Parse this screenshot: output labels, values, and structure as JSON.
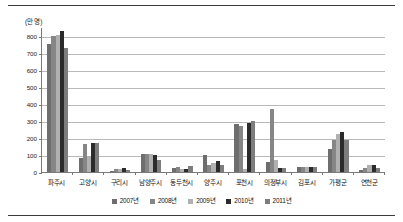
{
  "chart_data": {
    "type": "bar",
    "title": "",
    "subtitle": "",
    "xlabel": "",
    "ylabel": "",
    "unit_label": "(만 명)",
    "ylim": [
      0,
      850
    ],
    "yticks": [
      0,
      100,
      200,
      300,
      400,
      500,
      600,
      700,
      800
    ],
    "ytick_labels": [
      "0",
      "100",
      "200",
      "300",
      "400",
      "500",
      "600",
      "700",
      "800"
    ],
    "grid": true,
    "legend_position": "bottom",
    "categories": [
      "파주시",
      "고양시",
      "구리시",
      "남양주시",
      "동두천시",
      "양주시",
      "포천시",
      "의정부시",
      "김포시",
      "가평군",
      "연천군"
    ],
    "series": [
      {
        "name": "2007년",
        "color": "#6e6e6e",
        "values": [
          750,
          82,
          8,
          105,
          25,
          97,
          282,
          58,
          30,
          137,
          10
        ]
      },
      {
        "name": "2008년",
        "color": "#868686",
        "values": [
          800,
          165,
          18,
          108,
          28,
          42,
          272,
          368,
          32,
          185,
          25
        ]
      },
      {
        "name": "2009년",
        "color": "#b0b0b0",
        "values": [
          805,
          95,
          20,
          105,
          15,
          50,
          20,
          72,
          30,
          225,
          42
        ]
      },
      {
        "name": "2010년",
        "color": "#2b2b2b",
        "values": [
          825,
          168,
          22,
          100,
          18,
          62,
          290,
          25,
          30,
          232,
          42
        ]
      },
      {
        "name": "2011년",
        "color": "#7d7d7d",
        "values": [
          725,
          172,
          12,
          72,
          38,
          40,
          297,
          25,
          30,
          185,
          22
        ]
      }
    ]
  }
}
